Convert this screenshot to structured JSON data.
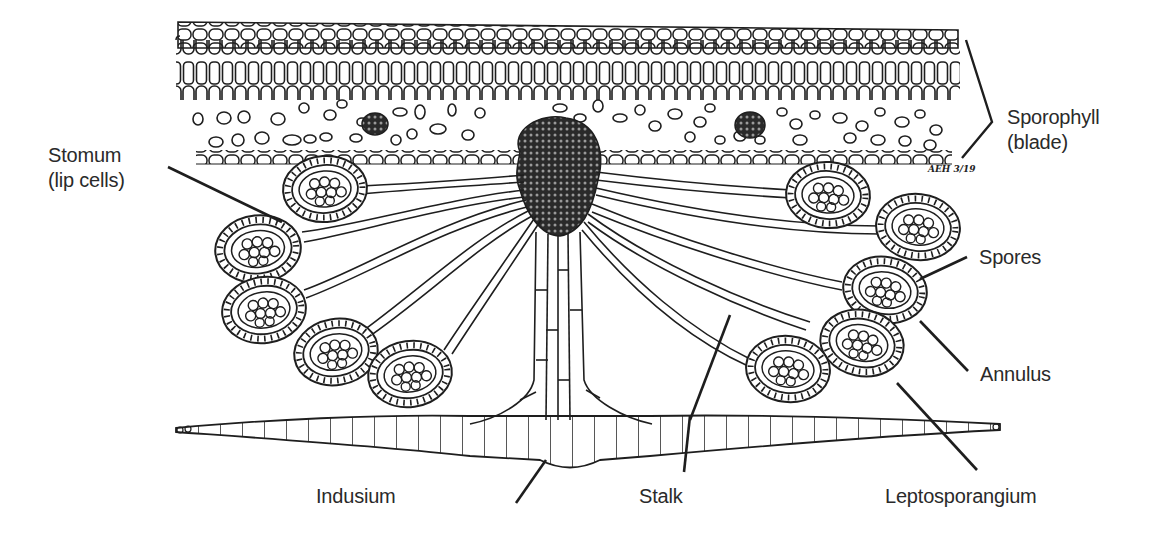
{
  "figure": {
    "artist_initials": "AEH 3/19",
    "line_color": "#1e1e1e",
    "background": "#ffffff"
  },
  "labels": {
    "sporophyll_line1": "Sporophyll",
    "sporophyll_line2": "(blade)",
    "stomum_line1": "Stomum",
    "stomum_line2": "(lip cells)",
    "spores": "Spores",
    "annulus": "Annulus",
    "indusium": "Indusium",
    "stalk": "Stalk",
    "leptosporangium": "Leptosporangium"
  }
}
